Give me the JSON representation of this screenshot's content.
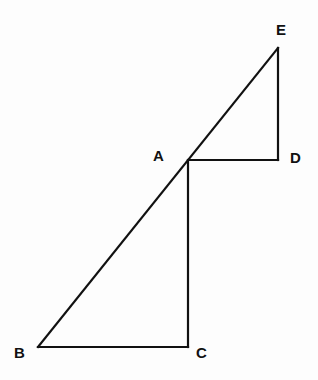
{
  "diagram": {
    "points": {
      "A": {
        "label": "A",
        "x": 189,
        "y": 160
      },
      "B": {
        "label": "B",
        "x": 38,
        "y": 347
      },
      "C": {
        "label": "C",
        "x": 187,
        "y": 347
      },
      "D": {
        "label": "D",
        "x": 278,
        "y": 160
      },
      "E": {
        "label": "E",
        "x": 278,
        "y": 48
      }
    },
    "segments": [
      "B-E",
      "A-C",
      "B-C",
      "A-D",
      "D-E"
    ],
    "stroke_color": "#111111"
  }
}
